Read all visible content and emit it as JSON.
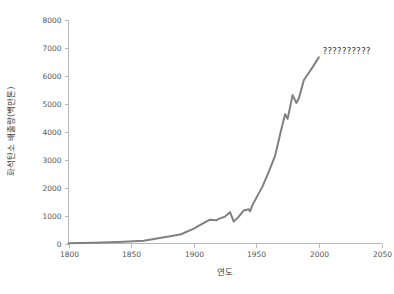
{
  "chart_data": {
    "type": "line",
    "title": "",
    "xlabel": "연도",
    "ylabel": "화석탄소 배출량(백만톤)",
    "xlim": [
      1800,
      2050
    ],
    "ylim": [
      0,
      8000
    ],
    "xticks": [
      1800,
      1850,
      1900,
      1950,
      2000,
      2050
    ],
    "yticks": [
      0,
      1000,
      2000,
      3000,
      4000,
      5000,
      6000,
      7000,
      8000
    ],
    "grid": false,
    "legend": "none",
    "annotations": [
      {
        "name": "unrendered-label",
        "text": "??????????",
        "x": 2003,
        "y": 6760
      }
    ],
    "series": [
      {
        "name": "fossil-carbon-emissions",
        "color": "#808080",
        "line_width": 2.0,
        "x": [
          1800,
          1820,
          1840,
          1860,
          1880,
          1890,
          1900,
          1910,
          1913,
          1918,
          1920,
          1925,
          1929,
          1932,
          1936,
          1940,
          1944,
          1945,
          1947,
          1950,
          1955,
          1960,
          1965,
          1970,
          1973,
          1975,
          1979,
          1982,
          1984,
          1988,
          1992,
          1995,
          2000
        ],
        "y": [
          8,
          30,
          55,
          95,
          250,
          330,
          530,
          780,
          850,
          830,
          880,
          960,
          1120,
          780,
          960,
          1180,
          1220,
          1150,
          1380,
          1630,
          2040,
          2570,
          3130,
          4080,
          4620,
          4450,
          5300,
          5020,
          5190,
          5840,
          6100,
          6300,
          6650
        ],
        "units": "million tonnes carbon"
      }
    ]
  },
  "axes": {
    "y_tick_labels": [
      "0",
      "1000",
      "2000",
      "3000",
      "4000",
      "5000",
      "6000",
      "7000",
      "8000"
    ],
    "x_tick_labels": [
      "1800",
      "1850",
      "1900",
      "1950",
      "2000",
      "2050"
    ]
  },
  "colors": {
    "line": "#808080",
    "axis": "#b9b9b9",
    "tick_label": "#555555",
    "axis_title": "#3a3a3a",
    "annotation": "#2e2e2e",
    "background": "#ffffff"
  }
}
